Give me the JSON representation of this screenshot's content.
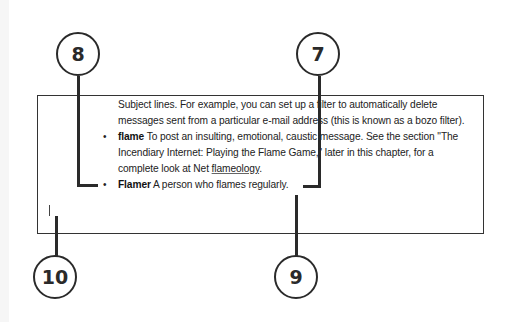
{
  "document": {
    "lines": [
      {
        "text": "Subject lines. For example, you can set up a filter to automatically delete"
      },
      {
        "text": "messages sent from a particular e-mail address (this is known as a bozo filter)."
      },
      {
        "bold": "flame",
        "text": " To post an insulting, emotional, caustic message. See the section \"The"
      },
      {
        "text": "Incendiary Internet: Playing the Flame Game,\" later in this chapter, for a"
      },
      {
        "prefix": "complete look at Net ",
        "underlined": "flameology",
        "suffix": "."
      },
      {
        "bold": "Flamer",
        "text": " A person who flames regularly."
      }
    ],
    "bullet_glyph": "•"
  },
  "callouts": [
    {
      "number": "8",
      "target": "bullet-before-flamer"
    },
    {
      "number": "7",
      "target": "end-of-flamer-line"
    },
    {
      "number": "9",
      "target": "insertion-point-after-period"
    },
    {
      "number": "10",
      "target": "text-cursor-new-line"
    }
  ],
  "colors": {
    "line": "#2a2a2a",
    "text": "#222222",
    "background": "#ffffff"
  }
}
